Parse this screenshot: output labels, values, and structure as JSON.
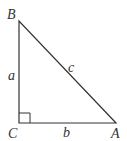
{
  "diagram": {
    "type": "right-triangle",
    "vertices": {
      "B": {
        "label": "B"
      },
      "C": {
        "label": "C"
      },
      "A": {
        "label": "A"
      }
    },
    "sides": {
      "a": {
        "label": "a"
      },
      "b": {
        "label": "b"
      },
      "c": {
        "label": "c"
      }
    },
    "right_angle_at": "C",
    "stroke_color": "#333333"
  }
}
